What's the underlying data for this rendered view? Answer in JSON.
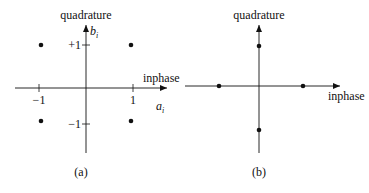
{
  "panels": [
    {
      "id": "a",
      "caption": "(a)",
      "y_axis_label": "quadrature",
      "x_axis_label": "inphase",
      "x_symbol": "a",
      "x_symbol_sub": "i",
      "y_symbol": "b",
      "y_symbol_sub": "i",
      "x_ticks": [
        "−1",
        "1"
      ],
      "y_ticks": [
        "+1",
        "−1"
      ],
      "points": [
        [
          -1,
          1
        ],
        [
          1,
          1
        ],
        [
          -1,
          -1
        ],
        [
          1,
          -1
        ]
      ]
    },
    {
      "id": "b",
      "caption": "(b)",
      "y_axis_label": "quadrature",
      "x_axis_label": "inphase",
      "points": [
        [
          -1,
          0
        ],
        [
          1,
          0
        ],
        [
          0,
          1
        ],
        [
          0,
          -1
        ]
      ]
    }
  ],
  "colors": {
    "ink": "#111111",
    "background": "#ffffff"
  }
}
